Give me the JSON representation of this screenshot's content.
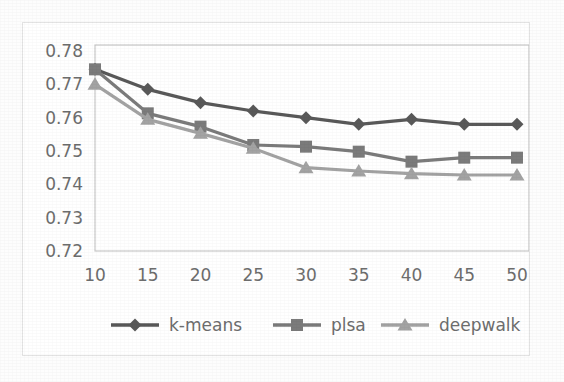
{
  "chart_data": {
    "type": "line",
    "title": "",
    "subtitle": "",
    "xlabel": "",
    "ylabel": "",
    "categories": [
      10,
      15,
      20,
      25,
      30,
      35,
      40,
      45,
      50
    ],
    "xtick_labels": [
      "10",
      "15",
      "20",
      "25",
      "30",
      "35",
      "40",
      "45",
      "50"
    ],
    "ytick_labels": [
      "0.78",
      "0.77",
      "0.76",
      "0.75",
      "0.74",
      "0.73",
      "0.72"
    ],
    "yticks": [
      0.78,
      0.77,
      0.76,
      0.75,
      0.74,
      0.73,
      0.72
    ],
    "ylim": [
      0.72,
      0.78
    ],
    "grid": false,
    "legend_position": "bottom",
    "series": [
      {
        "name": "k-means",
        "marker": "diamond",
        "color": "#595959",
        "values": [
          0.7745,
          0.7685,
          0.7645,
          0.762,
          0.76,
          0.758,
          0.7595,
          0.758,
          0.758
        ]
      },
      {
        "name": "plsa",
        "marker": "square",
        "color": "#7b7b7b",
        "values": [
          0.7745,
          0.7613,
          0.7573,
          0.7518,
          0.7513,
          0.7498,
          0.7468,
          0.748,
          0.748
        ]
      },
      {
        "name": "deepwalk",
        "marker": "triangle",
        "color": "#a3a3a3",
        "values": [
          0.77,
          0.7595,
          0.7553,
          0.7508,
          0.745,
          0.744,
          0.7432,
          0.7428,
          0.7428
        ]
      }
    ]
  },
  "legend": {
    "items": [
      {
        "label": "k-means"
      },
      {
        "label": "plsa"
      },
      {
        "label": "deepwalk"
      }
    ]
  },
  "colors": {
    "axis_line": "#c8c8c8",
    "tick_text": "#6d6d6d",
    "frame_border": "#e3e3e3",
    "plot_background": "#ffffff",
    "figure_background": "#fdfdfd"
  }
}
